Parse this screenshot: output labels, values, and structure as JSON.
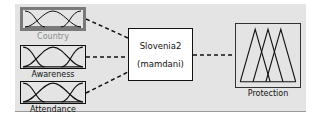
{
  "diagram": {
    "system": {
      "name": "Slovenia2",
      "type": "(mamdani)"
    },
    "inputs": [
      {
        "name": "Country",
        "selected": true
      },
      {
        "name": "Awareness",
        "selected": false
      },
      {
        "name": "Attendance",
        "selected": false
      }
    ],
    "outputs": [
      {
        "name": "Protection"
      }
    ]
  },
  "colors": {
    "panel_bg": "#e4e4e4",
    "selected_border": "#7a7a7a",
    "line": "#111111"
  }
}
